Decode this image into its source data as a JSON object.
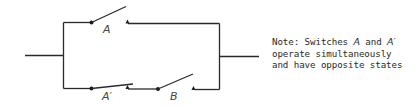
{
  "diagram": {
    "type": "switching circuit",
    "switches": [
      {
        "id": "A",
        "label": "A",
        "branch": "upper",
        "state": "open"
      },
      {
        "id": "A_prime",
        "label": "A′",
        "branch": "lower",
        "state": "open"
      },
      {
        "id": "B",
        "label": "B",
        "branch": "lower",
        "state": "open"
      }
    ],
    "topology": "A in parallel with (A' in series with B)"
  },
  "labels": {
    "switch_a": "A",
    "switch_a_prime": "A′",
    "switch_b": "B"
  },
  "note": {
    "line1_prefix": "Note: Switches ",
    "line1_a": "A",
    "line1_and": " and ",
    "line1_a_prime": "A′",
    "line2": "operate simultaneously",
    "line3": "and have opposite states"
  },
  "colors": {
    "wire": "#2a2a2a",
    "text": "#2a2a2a",
    "background": "#ffffff"
  }
}
